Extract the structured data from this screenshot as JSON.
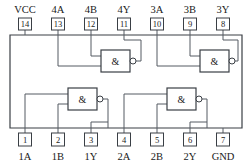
{
  "diagram": {
    "package": "14-pin DIP",
    "gate_symbol": "&",
    "colors": {
      "outline": "#3a3f45",
      "wire": "#555b63",
      "text": "#1a1a1a",
      "background": "#ffffff"
    }
  },
  "pins": {
    "top": [
      {
        "number": "14",
        "label": "VCC"
      },
      {
        "number": "13",
        "label": "4A"
      },
      {
        "number": "12",
        "label": "4B"
      },
      {
        "number": "11",
        "label": "4Y"
      },
      {
        "number": "10",
        "label": "3A"
      },
      {
        "number": "9",
        "label": "3B"
      },
      {
        "number": "8",
        "label": "3Y"
      }
    ],
    "bottom": [
      {
        "number": "1",
        "label": "1A"
      },
      {
        "number": "2",
        "label": "1B"
      },
      {
        "number": "3",
        "label": "1Y"
      },
      {
        "number": "4",
        "label": "2A"
      },
      {
        "number": "5",
        "label": "2B"
      },
      {
        "number": "6",
        "label": "2Y"
      },
      {
        "number": "7",
        "label": "GND"
      }
    ]
  },
  "gates": [
    {
      "name": "gate-4",
      "symbol": "&",
      "inputs": [
        "13",
        "12"
      ],
      "output": "11"
    },
    {
      "name": "gate-3",
      "symbol": "&",
      "inputs": [
        "10",
        "9"
      ],
      "output": "8"
    },
    {
      "name": "gate-1",
      "symbol": "&",
      "inputs": [
        "1",
        "2"
      ],
      "output": "3"
    },
    {
      "name": "gate-2",
      "symbol": "&",
      "inputs": [
        "4",
        "5"
      ],
      "output": "6"
    }
  ]
}
